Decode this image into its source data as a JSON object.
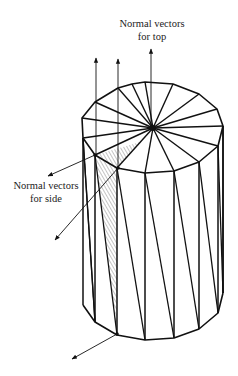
{
  "figure": {
    "sides": 16,
    "labels": {
      "top_line1": "Normal vectors",
      "top_line2": "for top",
      "side_line1": "Normal vectors",
      "side_line2": "for side"
    },
    "colors": {
      "stroke": "#111111",
      "hatch": "#555555",
      "background": "#ffffff"
    }
  }
}
